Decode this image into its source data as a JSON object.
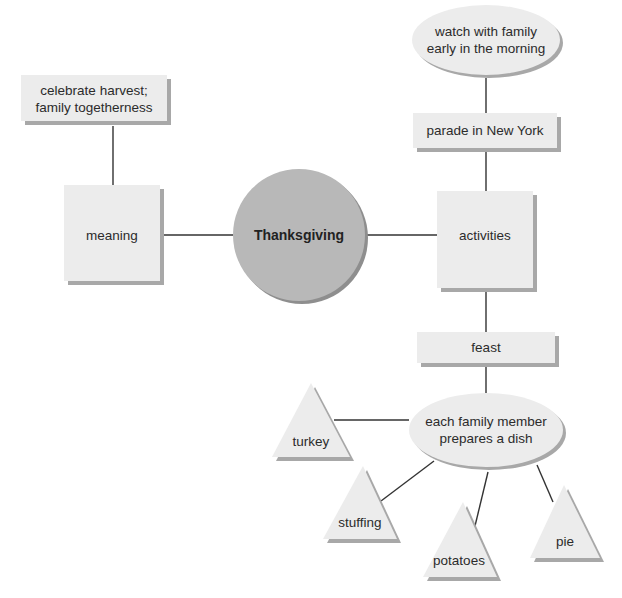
{
  "diagram": {
    "type": "concept-web",
    "colors": {
      "node_fill": "#ececec",
      "node_shadow": "#a8a8a8",
      "center_fill": "#b8b8b8",
      "line": "#333333",
      "text": "#2b2b2b"
    },
    "center": {
      "label": "Thanksgiving",
      "shape": "circle"
    },
    "nodes": {
      "meaning": {
        "label": "meaning",
        "shape": "square"
      },
      "meaning_detail": {
        "line1": "celebrate harvest;",
        "line2": "family togetherness",
        "shape": "rectangle"
      },
      "activities": {
        "label": "activities",
        "shape": "square"
      },
      "parade": {
        "label": "parade in New York",
        "shape": "rectangle"
      },
      "parade_detail": {
        "line1": "watch with family",
        "line2": "early in the morning",
        "shape": "ellipse"
      },
      "feast": {
        "label": "feast",
        "shape": "rectangle"
      },
      "feast_detail": {
        "line1": "each family member",
        "line2": "prepares a dish",
        "shape": "ellipse"
      },
      "dishes": [
        {
          "label": "turkey",
          "shape": "triangle"
        },
        {
          "label": "stuffing",
          "shape": "triangle"
        },
        {
          "label": "potatoes",
          "shape": "triangle"
        },
        {
          "label": "pie",
          "shape": "triangle"
        }
      ]
    },
    "edges": [
      [
        "meaning_detail",
        "meaning"
      ],
      [
        "meaning",
        "Thanksgiving"
      ],
      [
        "Thanksgiving",
        "activities"
      ],
      [
        "parade_detail",
        "parade"
      ],
      [
        "parade",
        "activities"
      ],
      [
        "activities",
        "feast"
      ],
      [
        "feast",
        "feast_detail"
      ],
      [
        "feast_detail",
        "turkey"
      ],
      [
        "feast_detail",
        "stuffing"
      ],
      [
        "feast_detail",
        "potatoes"
      ],
      [
        "feast_detail",
        "pie"
      ]
    ]
  }
}
